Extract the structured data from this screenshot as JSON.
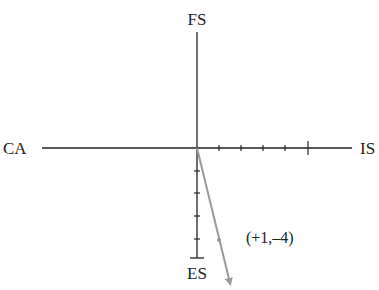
{
  "diagram": {
    "type": "coordinate-axes-vector",
    "axes": {
      "top_label": "FS",
      "left_label": "CA",
      "right_label": "IS",
      "bottom_label": "ES"
    },
    "vector": {
      "label": "(+1,–4)",
      "dx": 1,
      "dy": -4
    },
    "colors": {
      "axis": "#222222",
      "vector": "#999999",
      "text": "#222222"
    }
  }
}
